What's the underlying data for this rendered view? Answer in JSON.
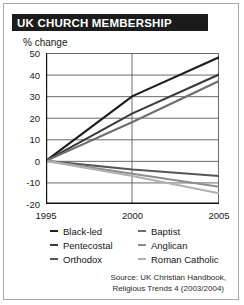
{
  "title": "UK CHURCH MEMBERSHIP",
  "source": {
    "line1": "Source: UK Christian Handbook,",
    "line2": "Religious Trends 4 (2003/2004)"
  },
  "chart_data": {
    "type": "line",
    "title": "UK CHURCH MEMBERSHIP",
    "xlabel": "",
    "ylabel": "% change",
    "x": [
      1995,
      2000,
      2005
    ],
    "xticks": [
      "1995",
      "2000",
      "2005"
    ],
    "xlim": [
      1995,
      2005
    ],
    "ylim": [
      -20,
      50
    ],
    "yticks": [
      50,
      40,
      30,
      20,
      10,
      0,
      -10,
      -20
    ],
    "ytick_labels": [
      "50",
      "40",
      "30",
      "20",
      "10",
      "0",
      "-10",
      "-20"
    ],
    "grid": true,
    "legend_position": "below",
    "series": [
      {
        "name": "Black-led",
        "values": [
          0,
          30,
          48
        ],
        "color": "#1e1e1e"
      },
      {
        "name": "Pentecostal",
        "values": [
          0,
          22,
          40
        ],
        "color": "#3b3b3b"
      },
      {
        "name": "Orthodox",
        "values": [
          0,
          -4,
          -7
        ],
        "color": "#555555"
      },
      {
        "name": "Baptist",
        "values": [
          0,
          18,
          37
        ],
        "color": "#6e6e6e"
      },
      {
        "name": "Anglican",
        "values": [
          0,
          -6,
          -12
        ],
        "color": "#8d8d8d"
      },
      {
        "name": "Roman Catholic",
        "values": [
          0,
          -7,
          -15
        ],
        "color": "#b0b0b0"
      }
    ]
  },
  "legend": {
    "rows": [
      [
        {
          "label": "Black-led",
          "color": "#1e1e1e"
        },
        {
          "label": "Baptist",
          "color": "#6e6e6e"
        }
      ],
      [
        {
          "label": "Pentecostal",
          "color": "#3b3b3b"
        },
        {
          "label": "Anglican",
          "color": "#8d8d8d"
        }
      ],
      [
        {
          "label": "Orthodox",
          "color": "#555555"
        },
        {
          "label": "Roman Catholic",
          "color": "#b0b0b0"
        }
      ]
    ]
  }
}
